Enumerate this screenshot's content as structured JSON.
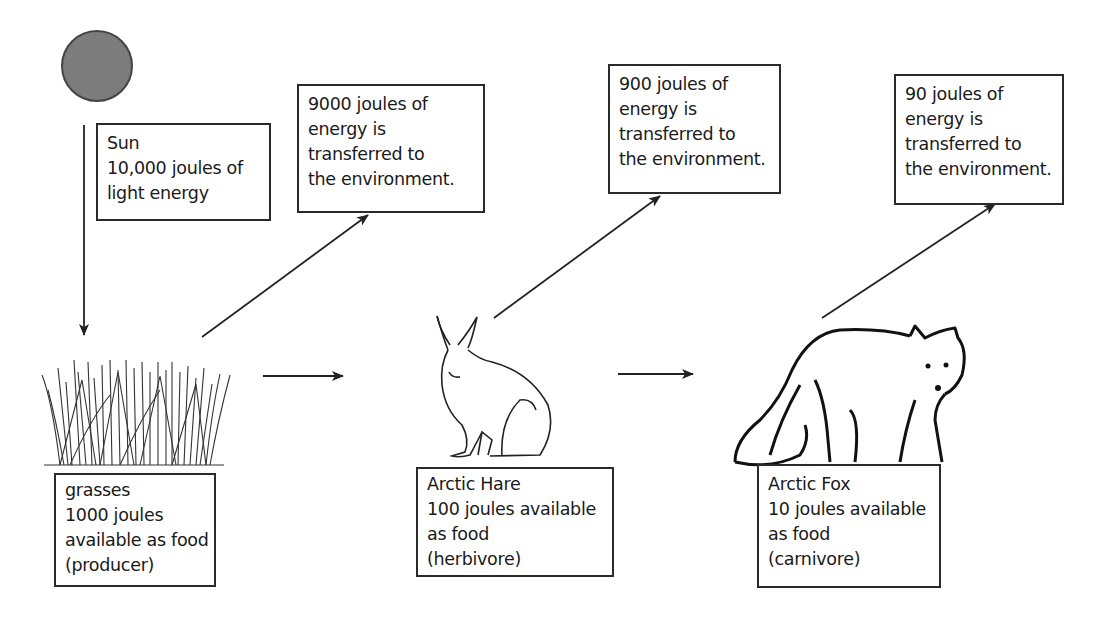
{
  "diagram": {
    "type": "energy-flow food chain",
    "sun": {
      "icon": "sun-circle-icon",
      "color": "#7c7c7c",
      "label_lines": [
        "Sun",
        "10,000 joules of",
        "light energy"
      ]
    },
    "environment_losses": [
      {
        "lines": [
          "9000 joules of",
          "energy is",
          "transferred to",
          "the environment."
        ]
      },
      {
        "lines": [
          "900 joules of",
          "energy is",
          "transferred to",
          "the environment."
        ]
      },
      {
        "lines": [
          "90 joules of",
          "energy is",
          "transferred to",
          "the environment."
        ]
      }
    ],
    "organisms": [
      {
        "icon": "grass-icon",
        "lines": [
          "grasses",
          "1000 joules",
          "available as food",
          "(producer)"
        ]
      },
      {
        "icon": "arctic-hare-icon",
        "lines": [
          "Arctic Hare",
          "100 joules available",
          "as food",
          "(herbivore)"
        ]
      },
      {
        "icon": "arctic-fox-icon",
        "lines": [
          "Arctic Fox",
          "10 joules available",
          "as food",
          "(carnivore)"
        ]
      }
    ],
    "flow": [
      {
        "from": "Sun",
        "to": "grasses",
        "energy_j": 10000
      },
      {
        "from": "grasses",
        "to": "environment",
        "energy_j": 9000
      },
      {
        "from": "grasses",
        "to": "Arctic Hare",
        "energy_j": 1000
      },
      {
        "from": "Arctic Hare",
        "to": "environment",
        "energy_j": 900
      },
      {
        "from": "Arctic Hare",
        "to": "Arctic Fox",
        "energy_j": 100
      },
      {
        "from": "Arctic Fox",
        "to": "environment",
        "energy_j": 90
      }
    ]
  }
}
